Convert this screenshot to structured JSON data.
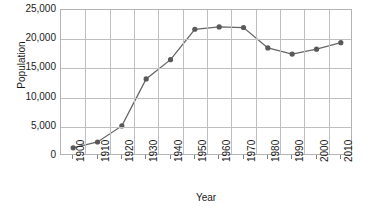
{
  "chart_data": {
    "type": "line",
    "title": "",
    "subtitle": "",
    "xlabel": "Year",
    "ylabel": "Population",
    "categories": [
      "1900",
      "1910",
      "1920",
      "1930",
      "1940",
      "1950",
      "1960",
      "1970",
      "1980",
      "1990",
      "2000",
      "2010"
    ],
    "values": [
      1400,
      2400,
      5150,
      13200,
      16500,
      21700,
      22100,
      22000,
      18500,
      17450,
      18300,
      19400
    ],
    "series": [
      {
        "name": "Population",
        "values": [
          1400,
          2400,
          5150,
          13200,
          16500,
          21700,
          22100,
          22000,
          18500,
          17450,
          18300,
          19400
        ]
      }
    ],
    "ylim": [
      0,
      25000
    ],
    "yticks": [
      0,
      5000,
      10000,
      15000,
      20000,
      25000
    ],
    "ytick_labels": [
      "0",
      "5,000",
      "10,000",
      "15,000",
      "20,000",
      "25,000"
    ],
    "xtick_labels": [
      "1900",
      "1910",
      "1920",
      "1930",
      "1940",
      "1950",
      "1960",
      "1970",
      "1980",
      "1990",
      "2000",
      "2010"
    ],
    "grid": "horizontal-and-vertical",
    "legend": "none",
    "marker": "filled-circle",
    "annotations": []
  },
  "style": {
    "line_color": "#666666",
    "marker_color": "#595959",
    "grid_color": "#bfbfbf",
    "border_color": "#b3b3b3",
    "text_color": "#1a1a1a",
    "background": "#ffffff"
  },
  "axis_titles": {
    "y": "Population",
    "x": "Year"
  }
}
